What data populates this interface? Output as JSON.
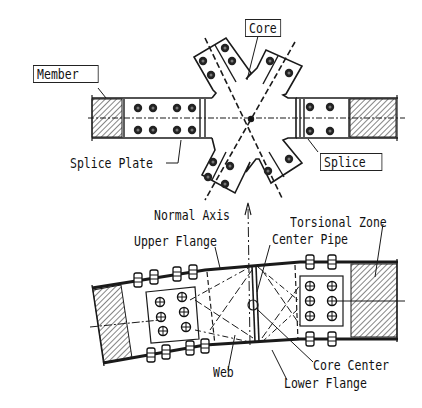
{
  "diagram": {
    "top_view": {
      "labels": {
        "core": "Core",
        "member": "Member",
        "splice_plate": "Splice Plate",
        "splice": "Splice"
      }
    },
    "side_view": {
      "labels": {
        "normal_axis": "Normal Axis",
        "torsional_zone": "Torsional Zone",
        "upper_flange": "Upper Flange",
        "center_pipe": "Center Pipe",
        "web": "Web",
        "core_center": "Core Center",
        "lower_flange": "Lower Flange"
      }
    },
    "colors": {
      "line": "#1a1a1a",
      "background": "#ffffff"
    }
  }
}
